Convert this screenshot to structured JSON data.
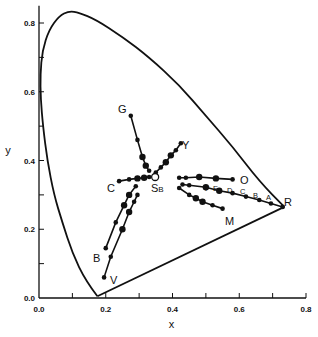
{
  "chart_data": {
    "type": "scatter",
    "title": "",
    "xlabel": "x",
    "ylabel": "y",
    "xlim": [
      0.0,
      0.8
    ],
    "ylim": [
      0.0,
      0.8
    ],
    "grid": false,
    "legend": "none",
    "x_ticks": [
      "0.0",
      "0.2",
      "0.4",
      "0.6",
      "0.8"
    ],
    "y_ticks": [
      "0.0",
      "0.2",
      "0.4",
      "0.6",
      "0.8"
    ],
    "spectrum_locus": [
      [
        0.175,
        0.005
      ],
      [
        0.14,
        0.05
      ],
      [
        0.1,
        0.13
      ],
      [
        0.07,
        0.22
      ],
      [
        0.045,
        0.3
      ],
      [
        0.025,
        0.4
      ],
      [
        0.012,
        0.5
      ],
      [
        0.005,
        0.58
      ],
      [
        0.004,
        0.65
      ],
      [
        0.01,
        0.72
      ],
      [
        0.03,
        0.78
      ],
      [
        0.06,
        0.82
      ],
      [
        0.09,
        0.835
      ],
      [
        0.12,
        0.83
      ],
      [
        0.17,
        0.81
      ],
      [
        0.25,
        0.76
      ],
      [
        0.33,
        0.7
      ],
      [
        0.42,
        0.62
      ],
      [
        0.5,
        0.53
      ],
      [
        0.58,
        0.44
      ],
      [
        0.66,
        0.34
      ],
      [
        0.735,
        0.265
      ]
    ],
    "purple_line": [
      [
        0.735,
        0.265
      ],
      [
        0.175,
        0.005
      ]
    ],
    "white_point": {
      "label": "SB",
      "x": 0.348,
      "y": 0.352
    },
    "series": [
      {
        "name": "G",
        "points": [
          [
            0.275,
            0.53
          ],
          [
            0.295,
            0.46
          ],
          [
            0.31,
            0.41
          ],
          [
            0.32,
            0.385
          ],
          [
            0.33,
            0.37
          ]
        ]
      },
      {
        "name": "Y",
        "points": [
          [
            0.35,
            0.365
          ],
          [
            0.365,
            0.38
          ],
          [
            0.38,
            0.395
          ],
          [
            0.395,
            0.415
          ],
          [
            0.41,
            0.43
          ],
          [
            0.425,
            0.45
          ]
        ]
      },
      {
        "name": "C",
        "points": [
          [
            0.24,
            0.34
          ],
          [
            0.27,
            0.345
          ],
          [
            0.295,
            0.348
          ],
          [
            0.315,
            0.35
          ],
          [
            0.33,
            0.352
          ]
        ]
      },
      {
        "name": "O",
        "points": [
          [
            0.42,
            0.35
          ],
          [
            0.44,
            0.35
          ],
          [
            0.48,
            0.352
          ],
          [
            0.53,
            0.348
          ],
          [
            0.58,
            0.345
          ]
        ]
      },
      {
        "name": "R",
        "points": [
          [
            0.43,
            0.33
          ],
          [
            0.45,
            0.328
          ],
          [
            0.5,
            0.322
          ],
          [
            0.54,
            0.312
          ],
          [
            0.58,
            0.305
          ],
          [
            0.62,
            0.295
          ],
          [
            0.66,
            0.285
          ],
          [
            0.695,
            0.275
          ],
          [
            0.73,
            0.265
          ]
        ],
        "point_labels": [
          "F",
          "E",
          "D",
          "C",
          "B",
          "A"
        ]
      },
      {
        "name": "M",
        "points": [
          [
            0.42,
            0.32
          ],
          [
            0.45,
            0.3
          ],
          [
            0.47,
            0.29
          ],
          [
            0.49,
            0.28
          ],
          [
            0.52,
            0.27
          ],
          [
            0.55,
            0.26
          ]
        ]
      },
      {
        "name": "B",
        "points": [
          [
            0.2,
            0.145
          ],
          [
            0.23,
            0.22
          ],
          [
            0.255,
            0.27
          ],
          [
            0.27,
            0.3
          ],
          [
            0.29,
            0.325
          ]
        ]
      },
      {
        "name": "V",
        "points": [
          [
            0.195,
            0.06
          ],
          [
            0.215,
            0.12
          ],
          [
            0.25,
            0.2
          ],
          [
            0.27,
            0.25
          ],
          [
            0.285,
            0.28
          ],
          [
            0.295,
            0.3
          ]
        ]
      }
    ],
    "annotations": [
      "G",
      "Y",
      "C",
      "O",
      "R",
      "M",
      "B",
      "V",
      "SB",
      "F",
      "E",
      "D",
      "C",
      "B",
      "A"
    ]
  }
}
